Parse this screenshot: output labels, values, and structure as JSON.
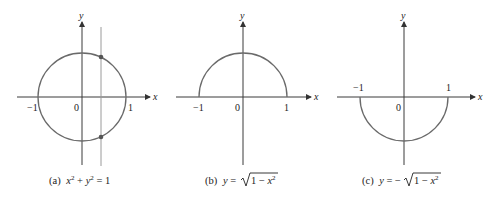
{
  "panels": [
    {
      "id": "a",
      "caption_prefix": "(a)",
      "caption_eq": "x² + y² = 1",
      "axis_x": "x",
      "axis_y": "y",
      "ticks": {
        "neg": "−1",
        "origin": "0",
        "pos": "1"
      },
      "description": "Full unit circle with vertical line crossing it at two points"
    },
    {
      "id": "b",
      "caption_prefix": "(b)",
      "caption_eq": "y = √1 − x²",
      "axis_x": "x",
      "axis_y": "y",
      "ticks": {
        "neg": "−1",
        "origin": "0",
        "pos": "1"
      },
      "description": "Upper semicircle"
    },
    {
      "id": "c",
      "caption_prefix": "(c)",
      "caption_eq": "y = −√1 − x²",
      "axis_x": "x",
      "axis_y": "y",
      "ticks": {
        "neg": "−1",
        "origin": "0",
        "pos": "1"
      },
      "description": "Lower semicircle"
    }
  ],
  "colors": {
    "axis": "#3a3a3a",
    "curve": "#6a6a6a",
    "vertical_line": "#9a9a9a"
  }
}
